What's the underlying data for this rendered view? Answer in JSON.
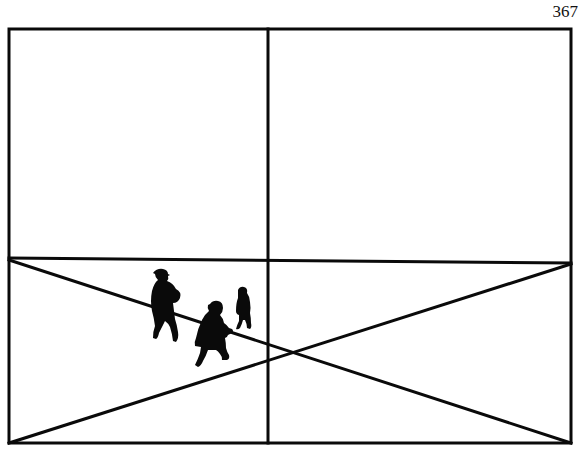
{
  "page": {
    "number": "367"
  },
  "figure": {
    "colors": {
      "ink": "#0a0a0a",
      "paper": "#ffffff"
    },
    "frame": {
      "left": 9,
      "top": 29,
      "right": 571,
      "bottom": 443
    },
    "lines": [
      {
        "name": "vertical-divider",
        "x1": 268,
        "y1": 29,
        "x2": 268,
        "y2": 443
      },
      {
        "name": "horizontal-divider",
        "x1": 9,
        "y1": 258,
        "x2": 571,
        "y2": 263
      },
      {
        "name": "diagonal-down",
        "x1": 9,
        "y1": 260,
        "x2": 571,
        "y2": 443
      },
      {
        "name": "diagonal-up",
        "x1": 9,
        "y1": 443,
        "x2": 571,
        "y2": 264
      }
    ],
    "figures": [
      "adult-with-hat",
      "adult-walking",
      "child"
    ]
  }
}
